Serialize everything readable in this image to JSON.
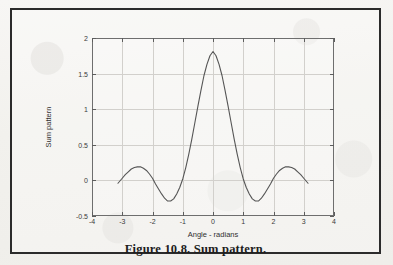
{
  "figure": {
    "caption": "Figure 10.8. Sum pattern."
  },
  "chart_data": {
    "type": "line",
    "title": "",
    "xlabel": "Angle - radians",
    "ylabel": "Sum pattern",
    "xlim": [
      -4,
      4
    ],
    "ylim": [
      -0.5,
      2
    ],
    "xticks": [
      -4,
      -3,
      -2,
      -1,
      0,
      1,
      2,
      3,
      4
    ],
    "xticklabels": [
      "-4",
      "-3",
      "-2",
      "-1",
      "0",
      "1",
      "2",
      "3",
      "4"
    ],
    "yticks": [
      -0.5,
      0,
      0.5,
      1,
      1.5,
      2
    ],
    "yticklabels": [
      "-0.5",
      "0",
      "0.5",
      "1",
      "1.5",
      "2"
    ],
    "grid": true,
    "legend": null,
    "line_color": "#555555",
    "series": [
      {
        "name": "Sum pattern",
        "x": [
          -3.1416,
          -3.0,
          -2.9,
          -2.8,
          -2.7,
          -2.6,
          -2.5,
          -2.4,
          -2.3,
          -2.2,
          -2.1,
          -2.0,
          -1.9,
          -1.8,
          -1.7,
          -1.6,
          -1.5,
          -1.4,
          -1.3,
          -1.2,
          -1.1,
          -1.0,
          -0.9,
          -0.8,
          -0.7,
          -0.6,
          -0.5,
          -0.4,
          -0.3,
          -0.2,
          -0.1,
          0.0,
          0.1,
          0.2,
          0.3,
          0.4,
          0.5,
          0.6,
          0.7,
          0.8,
          0.9,
          1.0,
          1.1,
          1.2,
          1.3,
          1.4,
          1.5,
          1.6,
          1.7,
          1.8,
          1.9,
          2.0,
          2.1,
          2.2,
          2.3,
          2.4,
          2.5,
          2.6,
          2.7,
          2.8,
          2.9,
          3.0,
          3.1416
        ],
        "y": [
          -0.04,
          0.03,
          0.08,
          0.12,
          0.16,
          0.18,
          0.19,
          0.19,
          0.17,
          0.14,
          0.09,
          0.03,
          -0.05,
          -0.12,
          -0.19,
          -0.25,
          -0.29,
          -0.29,
          -0.26,
          -0.19,
          -0.1,
          0.02,
          0.18,
          0.37,
          0.58,
          0.81,
          1.04,
          1.26,
          1.47,
          1.63,
          1.75,
          1.81,
          1.75,
          1.63,
          1.47,
          1.26,
          1.04,
          0.81,
          0.58,
          0.37,
          0.18,
          0.02,
          -0.1,
          -0.19,
          -0.26,
          -0.29,
          -0.29,
          -0.25,
          -0.19,
          -0.12,
          -0.05,
          0.03,
          0.09,
          0.14,
          0.17,
          0.19,
          0.19,
          0.18,
          0.16,
          0.12,
          0.08,
          0.03,
          -0.04
        ]
      }
    ]
  }
}
